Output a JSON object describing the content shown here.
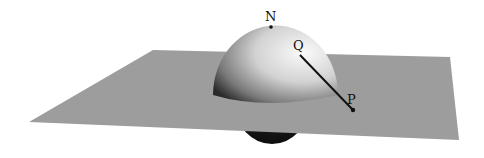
{
  "figure": {
    "labels": {
      "north_pole": "N",
      "sphere_point": "Q",
      "plane_point": "P"
    },
    "colors": {
      "plane": "#9a9a9a",
      "sphere_light": "#f4f4f4",
      "sphere_dark": "#2a2a2a",
      "line": "#111111"
    }
  }
}
